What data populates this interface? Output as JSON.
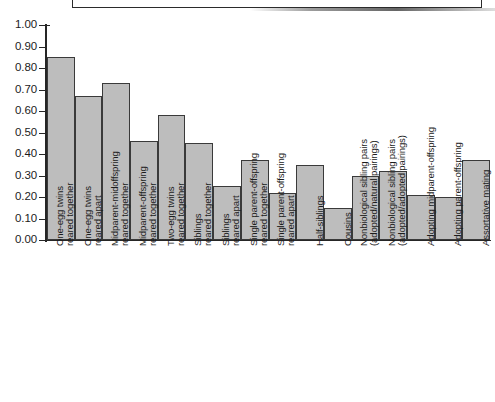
{
  "chart_data": {
    "type": "bar",
    "title": "",
    "subtitle": "",
    "xlabel": "",
    "ylabel": "",
    "ylim": [
      0.0,
      1.0
    ],
    "ytick_labels": [
      "1.00",
      "0.90",
      "0.80",
      "0.70",
      "0.60",
      "0.50",
      "0.40",
      "0.30",
      "0.20",
      "0.10",
      "0.00"
    ],
    "ytick_values": [
      1.0,
      0.9,
      0.8,
      0.7,
      0.6,
      0.5,
      0.4,
      0.3,
      0.2,
      0.1,
      0.0
    ],
    "grid": false,
    "legend": "none",
    "bar_fill_color": "#bdbdbd",
    "bar_edge_color": "#3a3a3a",
    "axis_color": "#262626",
    "categories": [
      "One-egg twins reared together",
      "One-egg twins reared apart",
      "Midparent-midoffspring reared together",
      "Midparent-offspring reared together",
      "Two-egg twins reared together",
      "Siblings reared together",
      "Siblings reared apart",
      "Single parent-offspring reared together",
      "Single parent-offspring reared apart",
      "Half-siblings",
      "Cousins",
      "Nonbiological sibling pairs (adopted/natural pairings)",
      "Nonbiological sibling pairs (adopted/adopted pairings)",
      "Adopting midparent-offspring",
      "Adopting parent-offspring",
      "Assortative mating"
    ],
    "values": [
      0.85,
      0.67,
      0.73,
      0.46,
      0.58,
      0.45,
      0.25,
      0.37,
      0.22,
      0.35,
      0.15,
      0.3,
      0.32,
      0.21,
      0.2,
      0.37
    ],
    "bars": [
      {
        "label_line1": "One-egg twins",
        "label_line2": "reared together",
        "value": 0.85
      },
      {
        "label_line1": "One-egg twins",
        "label_line2": "reared apart",
        "value": 0.67
      },
      {
        "label_line1": "Midparent-midoffspring",
        "label_line2": "reared together",
        "value": 0.73
      },
      {
        "label_line1": "Midparent-offspring",
        "label_line2": "reared together",
        "value": 0.46
      },
      {
        "label_line1": "Two-egg twins",
        "label_line2": "reared together",
        "value": 0.58
      },
      {
        "label_line1": "Siblings",
        "label_line2": "reared together",
        "value": 0.45
      },
      {
        "label_line1": "Siblings",
        "label_line2": "reared apart",
        "value": 0.25
      },
      {
        "label_line1": "Single parent-offspring",
        "label_line2": "reared together",
        "value": 0.37
      },
      {
        "label_line1": "Single parent-offspring",
        "label_line2": "reared apart",
        "value": 0.22
      },
      {
        "label_line1": "Half-siblings",
        "label_line2": "",
        "value": 0.35
      },
      {
        "label_line1": "Cousins",
        "label_line2": "",
        "value": 0.15
      },
      {
        "label_line1": "Nonbiological sibling pairs",
        "label_line2": "(adopted/natural pairings)",
        "value": 0.3
      },
      {
        "label_line1": "Nonbiological sibling pairs",
        "label_line2": "(adopted/adopted pairings)",
        "value": 0.32
      },
      {
        "label_line1": "Adopting midparent-offspring",
        "label_line2": "",
        "value": 0.21
      },
      {
        "label_line1": "Adopting parent-offspring",
        "label_line2": "",
        "value": 0.2
      },
      {
        "label_line1": "Assortative mating",
        "label_line2": "",
        "value": 0.37
      }
    ]
  }
}
